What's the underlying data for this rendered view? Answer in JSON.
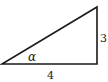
{
  "diagram": {
    "type": "right-triangle",
    "labels": {
      "vertical_side": "3",
      "horizontal_side": "4",
      "angle": "α"
    },
    "colors": {
      "stroke": "#1a1a1a",
      "text": "#222222",
      "background": "#ffffff"
    }
  }
}
